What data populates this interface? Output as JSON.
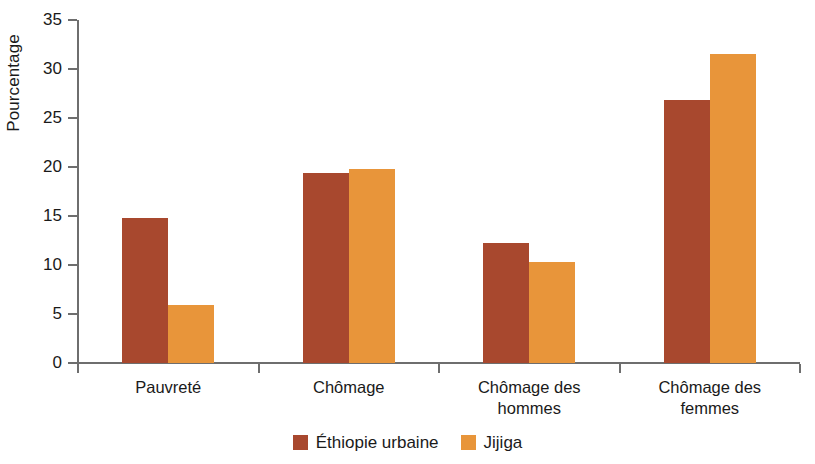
{
  "chart_data": {
    "type": "bar",
    "title": "",
    "subtitle": "",
    "xlabel": "",
    "ylabel": "Pourcentage",
    "ylim": [
      0,
      35
    ],
    "ytick_step": 5,
    "yticks": [
      "0",
      "5",
      "10",
      "15",
      "20",
      "25",
      "30",
      "35"
    ],
    "grid": false,
    "legend_position": "bottom-center",
    "categories": [
      "Pauvreté",
      "Chômage",
      "Chômage des\nhommes",
      "Chômage des\nfemmes"
    ],
    "category_lines": [
      [
        "Pauvreté"
      ],
      [
        "Chômage"
      ],
      [
        "Chômage des",
        "hommes"
      ],
      [
        "Chômage des",
        "femmes"
      ]
    ],
    "series": [
      {
        "name": "Éthiopie urbaine",
        "color": "#a8482e",
        "values": [
          14.8,
          19.4,
          12.2,
          26.8
        ]
      },
      {
        "name": "Jijiga",
        "color": "#e8953a",
        "values": [
          5.9,
          19.8,
          10.3,
          31.5
        ]
      }
    ]
  },
  "legend": {
    "items": [
      {
        "label": "Éthiopie urbaine",
        "color": "#a8482e"
      },
      {
        "label": "Jijiga",
        "color": "#e8953a"
      }
    ]
  },
  "colors": {
    "series_a": "#a8482e",
    "series_b": "#e8953a",
    "axis": "#6e6e6e",
    "text": "#1a1a1a",
    "background": "#ffffff"
  }
}
